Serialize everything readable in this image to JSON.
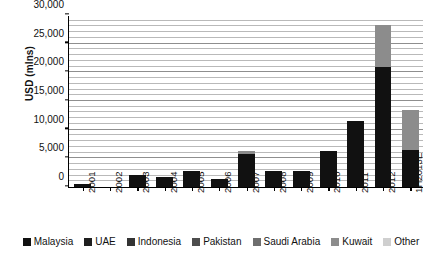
{
  "chart_data": {
    "type": "bar",
    "stacked": true,
    "title": "",
    "subtitle": "",
    "xlabel": "",
    "ylabel": "USD (mlns)",
    "ylim": [
      0,
      30000
    ],
    "ytick_values": [
      0,
      5000,
      10000,
      15000,
      20000,
      25000,
      30000
    ],
    "ytick_labels": [
      "0",
      "5,000",
      "10,000",
      "15,000",
      "20,000",
      "25,000",
      "30,000"
    ],
    "minor_gridline_step": 1000,
    "grid": true,
    "legend_position": "bottom",
    "categories": [
      "2001",
      "2002",
      "2003",
      "2004",
      "2005",
      "2006",
      "2007",
      "2008",
      "2009",
      "2010",
      "2011",
      "2012",
      "1H2013E"
    ],
    "series": [
      {
        "name": "Malaysia",
        "color": "#111111",
        "values": [
          600,
          0,
          2100,
          1750,
          2750,
          1400,
          5700,
          2800,
          2800,
          6300,
          11600,
          21000,
          6500
        ]
      },
      {
        "name": "UAE",
        "color": "#1f1f1f",
        "values": [
          0,
          0,
          0,
          0,
          0,
          0,
          0,
          0,
          0,
          0,
          0,
          0,
          0
        ]
      },
      {
        "name": "Indonesia",
        "color": "#333333",
        "values": [
          0,
          0,
          0,
          0,
          0,
          0,
          0,
          0,
          0,
          0,
          0,
          0,
          0
        ]
      },
      {
        "name": "Pakistan",
        "color": "#4d4d4d",
        "values": [
          0,
          0,
          0,
          0,
          0,
          0,
          0,
          0,
          0,
          0,
          0,
          0,
          0
        ]
      },
      {
        "name": "Saudi Arabia",
        "color": "#6e6e6e",
        "values": [
          0,
          0,
          0,
          0,
          0,
          0,
          0,
          0,
          0,
          0,
          0,
          0,
          0
        ]
      },
      {
        "name": "Kuwait",
        "color": "#8c8c8c",
        "values": [
          0,
          0,
          0,
          0,
          0,
          0,
          600,
          0,
          0,
          0,
          0,
          7300,
          7000
        ]
      },
      {
        "name": "Other",
        "color": "#cfcfcf",
        "values": [
          0,
          0,
          0,
          0,
          0,
          0,
          0,
          0,
          0,
          0,
          0,
          0,
          0
        ]
      }
    ],
    "totals": [
      600,
      0,
      2100,
      1750,
      2750,
      1400,
      6300,
      2800,
      2800,
      6300,
      11600,
      28300,
      13500
    ]
  },
  "legend": {
    "items": [
      {
        "label": "Malaysia"
      },
      {
        "label": "UAE"
      },
      {
        "label": "Indonesia"
      },
      {
        "label": "Pakistan"
      },
      {
        "label": "Saudi Arabia"
      },
      {
        "label": "Kuwait"
      },
      {
        "label": "Other"
      }
    ]
  }
}
